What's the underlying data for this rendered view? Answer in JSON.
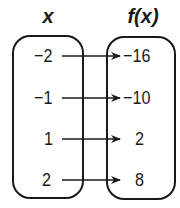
{
  "headers": {
    "domain": "x",
    "range": "f(x)"
  },
  "mapping": [
    {
      "x": "−2",
      "fx": "−16"
    },
    {
      "x": "−1",
      "fx": "−10"
    },
    {
      "x": "1",
      "fx": "2"
    },
    {
      "x": "2",
      "fx": "8"
    }
  ],
  "colors": {
    "stroke": "#1a1a1a",
    "background": "#ffffff"
  }
}
